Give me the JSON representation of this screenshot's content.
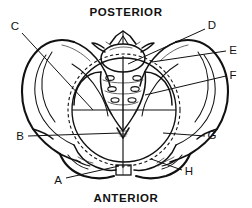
{
  "figure": {
    "background_color": "#ffffff",
    "line_color": "#111111",
    "width": 252,
    "height": 208
  },
  "orientation_labels": {
    "posterior": "POSTERIOR",
    "anterior": "ANTERIOR"
  },
  "callouts": [
    {
      "id": "A",
      "label": "A",
      "x": 58,
      "y": 181,
      "leader_to_x": 118,
      "leader_to_y": 166
    },
    {
      "id": "B",
      "label": "B",
      "x": 20,
      "y": 137,
      "leader_to_x": 119,
      "leader_to_y": 132
    },
    {
      "id": "C",
      "label": "C",
      "x": 15,
      "y": 27,
      "leader_to_x": 92,
      "leader_to_y": 109
    },
    {
      "id": "D",
      "label": "D",
      "x": 212,
      "y": 26,
      "leader_to_x": 127,
      "leader_to_y": 64
    },
    {
      "id": "E",
      "label": "E",
      "x": 233,
      "y": 51,
      "leader_to_x": 151,
      "leader_to_y": 62
    },
    {
      "id": "F",
      "label": "F",
      "x": 233,
      "y": 76,
      "leader_to_x": 146,
      "leader_to_y": 95
    },
    {
      "id": "G",
      "label": "G",
      "x": 212,
      "y": 136,
      "leader_to_x": 163,
      "leader_to_y": 132
    },
    {
      "id": "H",
      "label": "H",
      "x": 189,
      "y": 172,
      "leader_to_x": 150,
      "leader_to_y": 160
    }
  ],
  "anatomy_features": {
    "sacral_foramina_count": 6,
    "sacral_foramina_rows": 3,
    "inlet_circle": {
      "cx": 124,
      "cy": 110,
      "r": 52
    },
    "inlet_circle_dashed": {
      "cx": 124,
      "cy": 110,
      "r": 56
    },
    "transverse_diameter_y": 110,
    "conjugate_line_x": 123,
    "pubic_symphysis": {
      "x": 116,
      "y": 165,
      "width": 15,
      "height": 10
    }
  }
}
